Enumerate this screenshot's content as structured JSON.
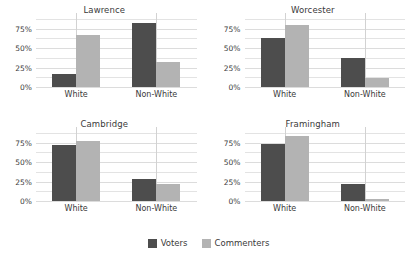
{
  "chart_data": {
    "type": "bar",
    "title": "",
    "xlabel": "",
    "ylabel": "",
    "ylim": [
      0,
      87.5
    ],
    "grid": true,
    "legend_position": "bottom",
    "categories": [
      "White",
      "Non-White"
    ],
    "series_names": [
      "Voters",
      "Commenters"
    ],
    "ytick_labels": [
      "0%",
      "25%",
      "50%",
      "75%"
    ],
    "ytick_values": [
      0,
      25,
      50,
      75
    ],
    "gridline_values": [
      0,
      12.5,
      25,
      37.5,
      50,
      62.5,
      75,
      87.5
    ],
    "colors": {
      "voters": "#4d4d4d",
      "commenters": "#b3b3b3",
      "gridline": "#e3e3e3",
      "background": "#ffffff",
      "text": "#3a3a3a"
    },
    "facets": [
      {
        "name": "Lawrence",
        "series": [
          {
            "name": "Voters",
            "values": [
              17,
              82
            ]
          },
          {
            "name": "Commenters",
            "values": [
              67,
              32
            ]
          }
        ]
      },
      {
        "name": "Worcester",
        "series": [
          {
            "name": "Voters",
            "values": [
              63,
              37
            ]
          },
          {
            "name": "Commenters",
            "values": [
              80,
              12
            ]
          }
        ]
      },
      {
        "name": "Cambridge",
        "series": [
          {
            "name": "Voters",
            "values": [
              72,
              28
            ]
          },
          {
            "name": "Commenters",
            "values": [
              77,
              22
            ]
          }
        ]
      },
      {
        "name": "Framingham",
        "series": [
          {
            "name": "Voters",
            "values": [
              74,
              22
            ]
          },
          {
            "name": "Commenters",
            "values": [
              84,
              2
            ]
          }
        ]
      }
    ]
  },
  "legend": {
    "items": [
      {
        "label": "Voters",
        "key": "voters"
      },
      {
        "label": "Commenters",
        "key": "commenters"
      }
    ]
  }
}
